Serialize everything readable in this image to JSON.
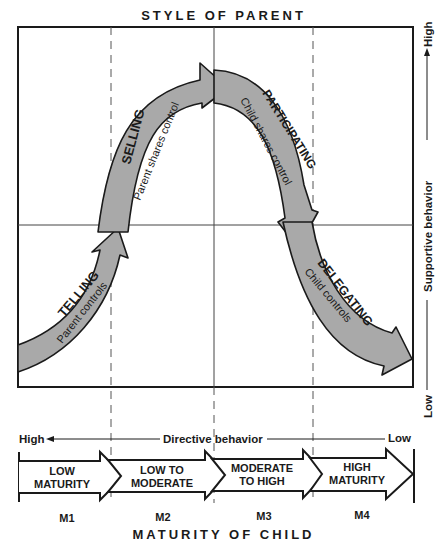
{
  "diagram": {
    "top_title": "STYLE OF PARENT",
    "bottom_title": "MATURITY OF CHILD",
    "vertical_axis": {
      "label": "Supportive behavior",
      "high": "High",
      "low": "Low"
    },
    "horizontal_axis": {
      "label": "Directive behavior",
      "high": "High",
      "low": "Low"
    },
    "styles": [
      {
        "name": "TELLING",
        "description": "Parent controls"
      },
      {
        "name": "SELLING",
        "description": "Parent shares control"
      },
      {
        "name": "PARTICIPATING",
        "description": "Child shares control"
      },
      {
        "name": "DELEGATING",
        "description": "Child controls"
      }
    ],
    "maturity_levels": [
      {
        "line1": "LOW",
        "line2": "MATURITY",
        "code": "M1"
      },
      {
        "line1": "LOW TO",
        "line2": "MODERATE",
        "code": "M2"
      },
      {
        "line1": "MODERATE",
        "line2": "TO HIGH",
        "code": "M3"
      },
      {
        "line1": "HIGH",
        "line2": "MATURITY",
        "code": "M4"
      }
    ],
    "colors": {
      "arrow_fill": "#a9a9a9",
      "stroke": "#1a1a1a",
      "grid": "#333333"
    }
  }
}
